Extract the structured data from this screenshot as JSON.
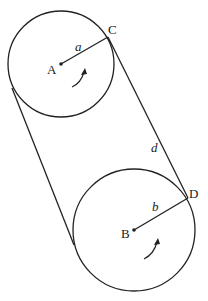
{
  "diagram": {
    "type": "two pulleys connected by an open belt",
    "stroke_color": "#222222",
    "background": "#ffffff",
    "circles": [
      {
        "id": "A",
        "label": "A",
        "cx": 61,
        "cy": 64,
        "r": 53,
        "radius_label": "a",
        "radius_point": "C",
        "rotation": "counterclockwise-arrow"
      },
      {
        "id": "B",
        "label": "B",
        "cx": 134,
        "cy": 230,
        "r": 61,
        "radius_label": "b",
        "radius_point": "D",
        "rotation": "counterclockwise-arrow"
      }
    ],
    "points": {
      "C": {
        "label": "C",
        "x": 108,
        "y": 37
      },
      "D": {
        "label": "D",
        "x": 188,
        "y": 198
      }
    },
    "segment_labels": {
      "a": "a",
      "b": "b",
      "d": "d"
    },
    "belt_segments": [
      {
        "name": "right-tangent",
        "from": "C",
        "to": "D",
        "label": "d"
      },
      {
        "name": "left-tangent",
        "x1": 12,
        "y1": 88,
        "x2": 74,
        "y2": 245
      }
    ]
  }
}
